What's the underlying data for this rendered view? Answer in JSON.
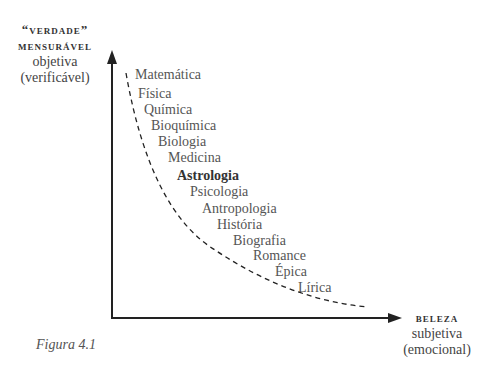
{
  "y_axis": {
    "line1": "“verdade”",
    "line2": "mensurável",
    "line3": "objetiva",
    "line4": "(verificável)"
  },
  "x_axis": {
    "line1": "beleza",
    "line2": "subjetiva",
    "line3": "(emocional)"
  },
  "items": [
    {
      "label": "Matemática",
      "bold": false
    },
    {
      "label": "Física",
      "bold": false
    },
    {
      "label": "Química",
      "bold": false
    },
    {
      "label": "Bioquímica",
      "bold": false
    },
    {
      "label": "Biologia",
      "bold": false
    },
    {
      "label": "Medicina",
      "bold": false
    },
    {
      "label": "Astrologia",
      "bold": true
    },
    {
      "label": "Psicologia",
      "bold": false
    },
    {
      "label": "Antropologia",
      "bold": false
    },
    {
      "label": "História",
      "bold": false
    },
    {
      "label": "Biografia",
      "bold": false
    },
    {
      "label": "Romance",
      "bold": false
    },
    {
      "label": "Épica",
      "bold": false
    },
    {
      "label": "Lírica",
      "bold": false
    }
  ],
  "caption": "Figura 4.1"
}
